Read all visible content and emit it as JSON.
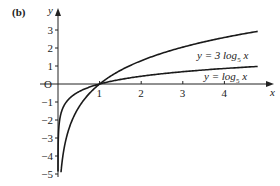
{
  "panel_label": "(b)",
  "chart_data": {
    "type": "line",
    "title": "",
    "xlabel": "x",
    "ylabel": "y",
    "origin_label": "O",
    "xlim": [
      0,
      5.2
    ],
    "ylim": [
      -5,
      4
    ],
    "x_ticks": [
      1,
      2,
      3,
      4
    ],
    "x_tick_labels": [
      "1",
      "2",
      "3",
      "4"
    ],
    "y_ticks": [
      3,
      2,
      1,
      -1,
      -2,
      -3,
      -4,
      -5
    ],
    "y_tick_labels": [
      "3",
      "2",
      "1",
      "−1",
      "−2",
      "−3",
      "−4",
      "−5"
    ],
    "grid": false,
    "legend": "inline annotations",
    "series": [
      {
        "name": "y = 3 log5 x",
        "label_main": "y = 3 log",
        "label_sub": "5",
        "label_tail": " x",
        "function": "3*log5(x)",
        "x": [
          0.15,
          0.2,
          0.3,
          0.5,
          0.75,
          1,
          1.5,
          2,
          2.5,
          3,
          3.5,
          4,
          4.5,
          4.8
        ],
        "values": [
          -3.54,
          -3.0,
          -2.24,
          -1.29,
          -0.54,
          0,
          0.76,
          1.29,
          1.71,
          2.05,
          2.34,
          2.58,
          2.8,
          2.92
        ]
      },
      {
        "name": "y = log5 x",
        "label_main": "y = log",
        "label_sub": "5",
        "label_tail": " x",
        "function": "log5(x)",
        "x": [
          0.0005,
          0.001,
          0.005,
          0.01,
          0.05,
          0.1,
          0.25,
          0.5,
          1,
          2,
          3,
          4,
          4.8
        ],
        "values": [
          -4.72,
          -4.29,
          -3.29,
          -2.86,
          -1.86,
          -1.43,
          -0.86,
          -0.43,
          0,
          0.43,
          0.68,
          0.86,
          0.975
        ]
      }
    ]
  }
}
